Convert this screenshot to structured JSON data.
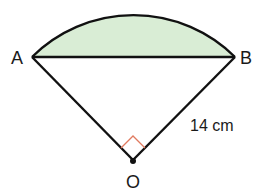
{
  "diagram": {
    "type": "circle-sector-segment",
    "points": {
      "A": {
        "label": "A",
        "x": 32,
        "y": 57
      },
      "B": {
        "label": "B",
        "x": 235,
        "y": 57
      },
      "O": {
        "label": "O",
        "x": 133,
        "y": 160
      }
    },
    "radius_label": "14 cm",
    "angle_at_O": "right-angle",
    "colors": {
      "segment_fill": "#d9edd5",
      "line": "#111111",
      "right_angle_marker": "#e07a5f"
    }
  }
}
